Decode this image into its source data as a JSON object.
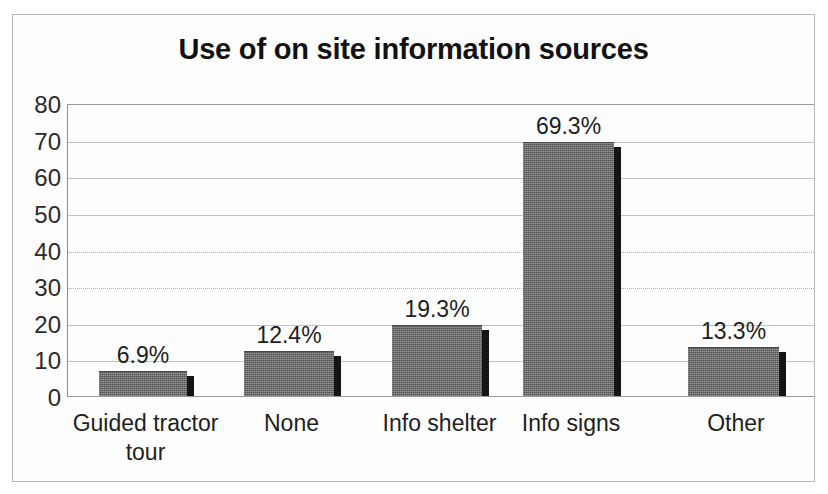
{
  "chart_data": {
    "type": "bar",
    "title": "Use of on site information sources",
    "xlabel": "",
    "ylabel": "",
    "categories": [
      "Guided tractor tour",
      "None",
      "Info shelter",
      "Info signs",
      "Other"
    ],
    "values": [
      6.9,
      12.4,
      19.3,
      69.3,
      13.3
    ],
    "data_labels": [
      "6.9%",
      "12.4%",
      "19.3%",
      "69.3%",
      "13.3%"
    ],
    "ylim": [
      0,
      80
    ],
    "y_ticks": [
      0,
      10,
      20,
      30,
      40,
      50,
      60,
      70,
      80
    ],
    "y_tick_labels": [
      "0",
      "10",
      "20",
      "30",
      "40",
      "50",
      "60",
      "70",
      "80"
    ],
    "grid": true,
    "legend": false,
    "legend_position": "none",
    "series_color": "#6e6e6e",
    "bar_shadow_color": "#151515",
    "gridline_color": "#c2c2c2",
    "text_color": "#1e1e1e",
    "background_color": "#fdfdfd",
    "border_color": "#b9b9b9"
  },
  "category_label_lines": [
    [
      "Guided tractor",
      "tour"
    ],
    [
      "None"
    ],
    [
      "Info shelter"
    ],
    [
      "Info signs"
    ],
    [
      "Other"
    ]
  ]
}
